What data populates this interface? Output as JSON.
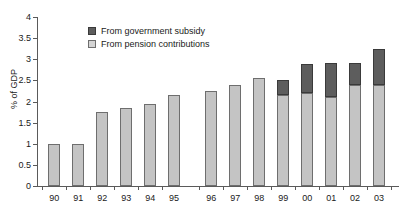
{
  "chart_data": {
    "type": "bar",
    "stacked": true,
    "title": "",
    "xlabel": "",
    "ylabel": "% of GDP",
    "ylim": [
      0,
      4
    ],
    "ytick_step": 0.5,
    "yticks": [
      "0",
      "0.5",
      "1",
      "1.5",
      "2",
      "2.5",
      "3",
      "3.5",
      "4"
    ],
    "grid": false,
    "legend_position": "top-left",
    "categories": [
      "90",
      "91",
      "92",
      "93",
      "94",
      "95",
      "96",
      "97",
      "98",
      "99",
      "00",
      "01",
      "02",
      "03"
    ],
    "category_gap_after": "95",
    "series": [
      {
        "name": "From pension contributions",
        "color": "#c4c4c4",
        "values": [
          1.0,
          1.0,
          1.75,
          1.85,
          1.95,
          2.15,
          2.25,
          2.4,
          2.55,
          2.15,
          2.2,
          2.1,
          2.4,
          2.4
        ]
      },
      {
        "name": "From government subsidy",
        "color": "#5d5d5d",
        "values": [
          0,
          0,
          0,
          0,
          0,
          0,
          0,
          0,
          0,
          0.35,
          0.7,
          0.8,
          0.5,
          0.85
        ]
      }
    ],
    "totals": [
      1.0,
      1.0,
      1.75,
      1.85,
      1.95,
      2.15,
      2.25,
      2.4,
      2.55,
      2.5,
      2.9,
      2.9,
      2.9,
      3.25
    ]
  }
}
